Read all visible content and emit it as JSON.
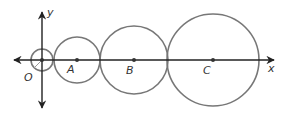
{
  "diagram": {
    "axes": {
      "x_label": "x",
      "y_label": "y",
      "origin": [
        42,
        60
      ]
    },
    "circles": [
      {
        "name": "O",
        "label": "O",
        "cx": 42,
        "cy": 60,
        "r": 11,
        "label_pos": [
          24,
          82
        ]
      },
      {
        "name": "A",
        "label": "A",
        "cx": 77,
        "cy": 60,
        "r": 23,
        "label_pos": [
          67,
          73
        ]
      },
      {
        "name": "B",
        "label": "B",
        "cx": 134,
        "cy": 60,
        "r": 34,
        "label_pos": [
          126,
          75
        ]
      },
      {
        "name": "C",
        "label": "C",
        "cx": 213,
        "cy": 60,
        "r": 46,
        "label_pos": [
          203,
          75
        ]
      }
    ],
    "colors": {
      "axis": "#222222",
      "circle": "#777777",
      "point": "#333333"
    }
  }
}
